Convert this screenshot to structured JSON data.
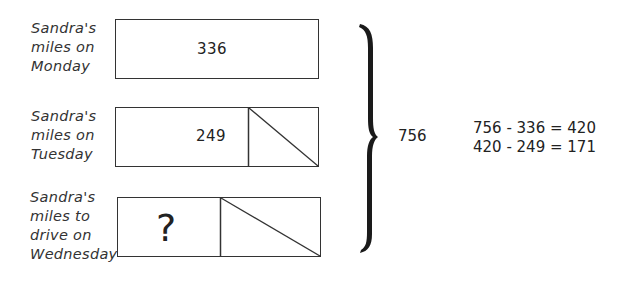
{
  "rows": [
    {
      "label_lines": [
        "Sandra's",
        "miles on",
        "Monday"
      ],
      "value": "336"
    },
    {
      "label_lines": [
        "Sandra's",
        "miles on",
        "Tuesday"
      ],
      "value": "249"
    },
    {
      "label_lines": [
        "Sandra's",
        "miles to",
        "drive on",
        "Wednesday"
      ],
      "value": "?"
    }
  ],
  "total": "756",
  "equations": [
    "756 - 336 = 420",
    "420 - 249 = 171"
  ]
}
